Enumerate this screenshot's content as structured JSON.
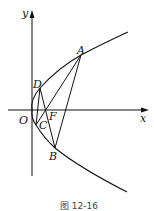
{
  "figure": {
    "caption": "图 12-16",
    "axes": {
      "x_label": "x",
      "y_label": "y",
      "origin_label": "O"
    },
    "curve": "parabola opening right, vertex at origin",
    "points": {
      "A": "A",
      "B": "B",
      "C": "C",
      "D": "D",
      "F": "F"
    },
    "segments": [
      "DC",
      "DB",
      "CA",
      "AB"
    ],
    "colors": {
      "stroke": "#111111",
      "background": "#ffffff"
    }
  }
}
